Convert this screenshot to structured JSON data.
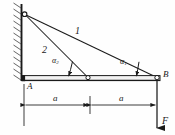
{
  "figure": {
    "background": "#fefefe",
    "ink": "#1a1a1a"
  },
  "wall": {
    "name": "hatched-fixed-wall",
    "x": 21,
    "top": 4,
    "bottom": 80,
    "hatch_count": 13
  },
  "joints": {
    "top_pin": {
      "label": "",
      "x": 24,
      "y": 14
    },
    "mid_pin": {
      "label": "",
      "x": 88,
      "y": 78
    },
    "b_pin": {
      "label": "B",
      "x": 157,
      "y": 78
    }
  },
  "points": {
    "a_label": "A",
    "b_label": "B"
  },
  "members": {
    "one": {
      "label": "1",
      "from_x": 24,
      "from_y": 14,
      "to_x": 157,
      "to_y": 78
    },
    "two": {
      "label": "2",
      "from_x": 24,
      "from_y": 14,
      "to_x": 88,
      "to_y": 78
    }
  },
  "angles": {
    "alpha1": {
      "symbol": "α",
      "sub": "1",
      "x": 122,
      "y": 63
    },
    "alpha2": {
      "symbol": "α",
      "sub": "2",
      "x": 53,
      "y": 61
    }
  },
  "beam": {
    "name": "horizontal-beam-AB",
    "x1": 22,
    "x2": 160,
    "y": 78,
    "thickness": 5
  },
  "dimensions": {
    "left": {
      "label": "a",
      "x1": 24,
      "x2": 90,
      "y": 105
    },
    "right": {
      "label": "a",
      "x1": 90,
      "x2": 157,
      "y": 105
    }
  },
  "force": {
    "label": "F",
    "x": 157,
    "y_start": 80,
    "y_end": 128,
    "direction": "down"
  }
}
